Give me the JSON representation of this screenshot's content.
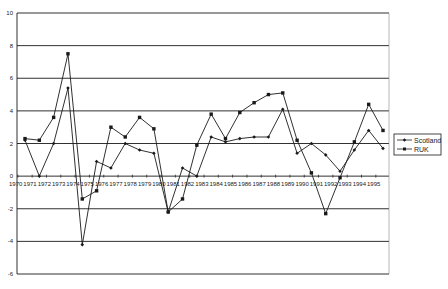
{
  "chart_data": {
    "type": "line",
    "title": "",
    "xlabel": "",
    "ylabel": "",
    "ylim": [
      -6,
      10
    ],
    "yticks": [
      10,
      8,
      6,
      4,
      2,
      0,
      -2,
      -4,
      -6
    ],
    "grid": true,
    "legend_position": "right",
    "categories": [
      "1970",
      "1971",
      "1972",
      "1973",
      "1974",
      "1975",
      "1976",
      "1977",
      "1978",
      "1979",
      "1980",
      "1981",
      "1982",
      "1983",
      "1984",
      "1985",
      "1986",
      "1987",
      "1988",
      "1989",
      "1990",
      "1991",
      "1992",
      "1993",
      "1994",
      "1995"
    ],
    "series": [
      {
        "name": "Scotland",
        "marker": "diamond",
        "values": [
          2.2,
          0.0,
          2.0,
          5.4,
          -4.2,
          0.9,
          0.5,
          2.0,
          1.6,
          1.4,
          -2.2,
          0.5,
          0.0,
          2.4,
          2.1,
          2.3,
          2.4,
          2.4,
          4.1,
          1.4,
          2.0,
          1.3,
          0.3,
          1.6,
          2.8,
          1.7
        ]
      },
      {
        "name": "RUK",
        "marker": "square",
        "values": [
          2.3,
          2.2,
          3.6,
          7.5,
          -1.4,
          -0.9,
          3.0,
          2.4,
          3.6,
          2.9,
          -2.2,
          -1.4,
          1.9,
          3.8,
          2.3,
          3.9,
          4.5,
          5.0,
          5.1,
          2.2,
          0.2,
          -2.3,
          -0.1,
          2.1,
          4.4,
          2.8
        ]
      }
    ]
  },
  "legend": {
    "items": [
      {
        "label": "Scotland"
      },
      {
        "label": "RUK"
      }
    ]
  },
  "colors": {
    "line": "#1a1a1a",
    "grid": "#1a1a1a",
    "text": "#222222"
  }
}
